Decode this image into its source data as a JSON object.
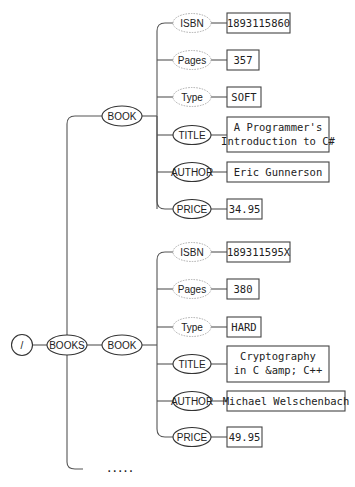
{
  "diagram": {
    "type": "xml-tree",
    "root": {
      "label": "/"
    },
    "books": {
      "label": "BOOKS"
    },
    "book_label": "BOOK",
    "books_list": [
      {
        "label": "BOOK",
        "fields": [
          {
            "name": "ISBN",
            "kind": "attribute",
            "value": [
              "1893115860"
            ]
          },
          {
            "name": "Pages",
            "kind": "attribute",
            "value": [
              "357"
            ]
          },
          {
            "name": "Type",
            "kind": "attribute",
            "value": [
              "SOFT"
            ]
          },
          {
            "name": "TITLE",
            "kind": "element",
            "value": [
              "A Programmer's",
              "Introduction to C#"
            ]
          },
          {
            "name": "AUTHOR",
            "kind": "element",
            "value": [
              "Eric Gunnerson"
            ]
          },
          {
            "name": "PRICE",
            "kind": "element",
            "value": [
              "34.95"
            ]
          }
        ]
      },
      {
        "label": "BOOK",
        "fields": [
          {
            "name": "ISBN",
            "kind": "attribute",
            "value": [
              "189311595X"
            ]
          },
          {
            "name": "Pages",
            "kind": "attribute",
            "value": [
              "380"
            ]
          },
          {
            "name": "Type",
            "kind": "attribute",
            "value": [
              "HARD"
            ]
          },
          {
            "name": "TITLE",
            "kind": "element",
            "value": [
              "Cryptography",
              "in C &amp; C++"
            ]
          },
          {
            "name": "AUTHOR",
            "kind": "element",
            "value": [
              "Michael Welschenbach"
            ]
          },
          {
            "name": "PRICE",
            "kind": "element",
            "value": [
              "49.95"
            ]
          }
        ]
      }
    ],
    "ellipsis": "....."
  }
}
